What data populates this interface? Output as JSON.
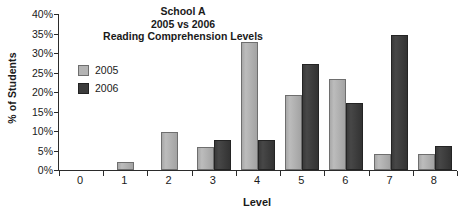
{
  "chart_data": {
    "type": "bar",
    "title": "School A\n2005 vs 2006\nReading Comprehension Levels",
    "title_lines": [
      "School A",
      "2005 vs 2006",
      "Reading Comprehension Levels"
    ],
    "xlabel": "Level",
    "ylabel": "% of Students",
    "categories": [
      "0",
      "1",
      "2",
      "3",
      "4",
      "5",
      "6",
      "7",
      "8"
    ],
    "series": [
      {
        "name": "2005",
        "color": "#b4b4b4",
        "values": [
          0,
          2.0,
          9.7,
          5.8,
          32.7,
          19.3,
          23.3,
          4.0,
          4.2
        ]
      },
      {
        "name": "2006",
        "color": "#3c3c3c",
        "values": [
          0,
          0,
          0,
          7.6,
          7.6,
          27.1,
          17.3,
          34.7,
          6.1
        ]
      }
    ],
    "ylim": [
      0,
      40
    ],
    "ytick_values": [
      0,
      5,
      10,
      15,
      20,
      25,
      30,
      35,
      40
    ],
    "ytick_labels": [
      "0%",
      "5%",
      "10%",
      "15%",
      "20%",
      "25%",
      "30%",
      "35%",
      "40%"
    ],
    "grid": false,
    "legend_position": "upper-left-inside"
  },
  "legend": {
    "entries": [
      {
        "label": "2005"
      },
      {
        "label": "2006"
      }
    ]
  }
}
